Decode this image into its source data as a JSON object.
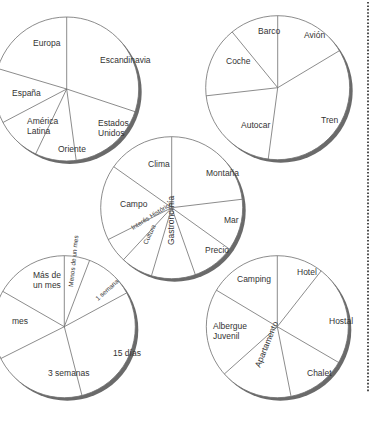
{
  "colors": {
    "line": "#6f6f6f",
    "shadow": "#6a6a6a",
    "text": "#333333",
    "background": "#ffffff",
    "dotted_rule": "#222222"
  },
  "dotted_rule": {
    "x": 368,
    "y1": 2,
    "y2": 393
  },
  "chart_data": [
    {
      "type": "pie",
      "title": "",
      "id": "destinations",
      "center": [
        66.7,
        89
      ],
      "radius": 72,
      "start_angle_deg_clockwise_from_top": 0,
      "slices": [
        {
          "label": "Escandinavia",
          "lines": [
            "Escandinavia"
          ],
          "percent": 30.1,
          "label_pos": [
            100,
            63
          ]
        },
        {
          "label": "Estados Unidos",
          "lines": [
            "Estados",
            "Unidos"
          ],
          "percent": 17.8,
          "label_pos": [
            98,
            126
          ]
        },
        {
          "label": "Oriente",
          "lines": [
            "Oriente"
          ],
          "percent": 9.2,
          "label_pos": [
            58,
            152
          ]
        },
        {
          "label": "América Latina",
          "lines": [
            "América",
            "Latina"
          ],
          "percent": 10.2,
          "label_pos": [
            27,
            124
          ]
        },
        {
          "label": "España",
          "lines": [
            "España"
          ],
          "percent": 12.3,
          "label_pos": [
            12,
            96
          ]
        },
        {
          "label": "Europa",
          "lines": [
            "Europa"
          ],
          "percent": 20.4,
          "label_pos": [
            33,
            46
          ]
        }
      ]
    },
    {
      "type": "pie",
      "title": "",
      "id": "transport",
      "center": [
        277.7,
        87.7
      ],
      "radius": 72,
      "start_angle_deg_clockwise_from_top": 0,
      "slices": [
        {
          "label": "Avión",
          "lines": [
            "Avión"
          ],
          "percent": 16.4,
          "label_pos": [
            304,
            38
          ]
        },
        {
          "label": "Tren",
          "lines": [
            "Tren"
          ],
          "percent": 35.7,
          "label_pos": [
            321,
            123
          ]
        },
        {
          "label": "Autocar",
          "lines": [
            "Autocar"
          ],
          "percent": 21.1,
          "label_pos": [
            241,
            128
          ]
        },
        {
          "label": "Coche",
          "lines": [
            "Coche"
          ],
          "percent": 15.9,
          "label_pos": [
            226,
            64
          ]
        },
        {
          "label": "Barco",
          "lines": [
            "Barco"
          ],
          "percent": 10.9,
          "label_pos": [
            258,
            34
          ]
        }
      ]
    },
    {
      "type": "pie",
      "title": "",
      "id": "reasons",
      "center": [
        171.7,
        207.7
      ],
      "radius": 71,
      "start_angle_deg_clockwise_from_top": 0,
      "slices": [
        {
          "label": "Montaña",
          "lines": [
            "Montaña"
          ],
          "percent": 23.1,
          "label_pos": [
            206,
            176
          ]
        },
        {
          "label": "Mar",
          "lines": [
            "Mar"
          ],
          "percent": 11.8,
          "label_pos": [
            224,
            223
          ]
        },
        {
          "label": "Precio",
          "lines": [
            "Precio"
          ],
          "percent": 9.7,
          "label_pos": [
            205,
            253
          ]
        },
        {
          "label": "Gastronomía",
          "lines": [
            "Gastronomía"
          ],
          "percent": 10.0,
          "label_pos": [
            174,
            245
          ],
          "rotate": -90
        },
        {
          "label": "Cultura",
          "lines": [
            "Cultura"
          ],
          "percent": 7.3,
          "label_pos": [
            147,
            245
          ],
          "rotate": -65,
          "small": true
        },
        {
          "label": "Interés Histórico",
          "lines": [
            "Interés Histórico"
          ],
          "percent": 5.7,
          "label_pos": [
            133,
            230
          ],
          "rotate": -32,
          "small": true
        },
        {
          "label": "Campo",
          "lines": [
            "Campo"
          ],
          "percent": 17.2,
          "label_pos": [
            120,
            207
          ]
        },
        {
          "label": "Clima",
          "lines": [
            "Clima"
          ],
          "percent": 15.3,
          "label_pos": [
            148,
            167
          ]
        }
      ]
    },
    {
      "type": "pie",
      "title": "",
      "id": "duration",
      "center": [
        64.3,
        326.7
      ],
      "radius": 71,
      "start_angle_deg_clockwise_from_top": 0,
      "slices": [
        {
          "label": "Menos de un mes",
          "lines": [
            "Menos de un mes"
          ],
          "percent": 5.8,
          "label_pos": [
            73,
            287
          ],
          "rotate": -84,
          "small": true
        },
        {
          "label": "1 semana",
          "lines": [
            "1 semana"
          ],
          "percent": 11.3,
          "label_pos": [
            98,
            301
          ],
          "rotate": -42,
          "small": true
        },
        {
          "label": "15 días",
          "lines": [
            "15 días"
          ],
          "percent": 28.9,
          "label_pos": [
            113,
            356
          ]
        },
        {
          "label": "3 semanas",
          "lines": [
            "3 semanas"
          ],
          "percent": 21.6,
          "label_pos": [
            48,
            376
          ]
        },
        {
          "label": "Un mes",
          "lines": [
            "mes"
          ],
          "percent": 15.7,
          "label_pos": [
            12,
            324
          ]
        },
        {
          "label": "Más de un mes",
          "lines": [
            "Más de",
            "un mes"
          ],
          "percent": 16.7,
          "label_pos": [
            33,
            278
          ]
        }
      ]
    },
    {
      "type": "pie",
      "title": "",
      "id": "accommodation",
      "center": [
        277.3,
        326.7
      ],
      "radius": 71,
      "start_angle_deg_clockwise_from_top": 0,
      "slices": [
        {
          "label": "Hotel",
          "lines": [
            "Hotel"
          ],
          "percent": 10.6,
          "label_pos": [
            297,
            275
          ]
        },
        {
          "label": "Hostal",
          "lines": [
            "Hostal"
          ],
          "percent": 22.8,
          "label_pos": [
            329,
            324
          ]
        },
        {
          "label": "Chalet",
          "lines": [
            "Chalet"
          ],
          "percent": 13.5,
          "label_pos": [
            307,
            376
          ]
        },
        {
          "label": "Apartamento",
          "lines": [
            "Apartamento"
          ],
          "percent": 16.5,
          "label_pos": [
            260,
            368
          ],
          "rotate": -68
        },
        {
          "label": "Albergue Juvenil",
          "lines": [
            "Albergue",
            "Juvenil"
          ],
          "percent": 20.2,
          "label_pos": [
            213,
            329
          ]
        },
        {
          "label": "Camping",
          "lines": [
            "Camping"
          ],
          "percent": 16.4,
          "label_pos": [
            237,
            282
          ]
        }
      ]
    }
  ]
}
